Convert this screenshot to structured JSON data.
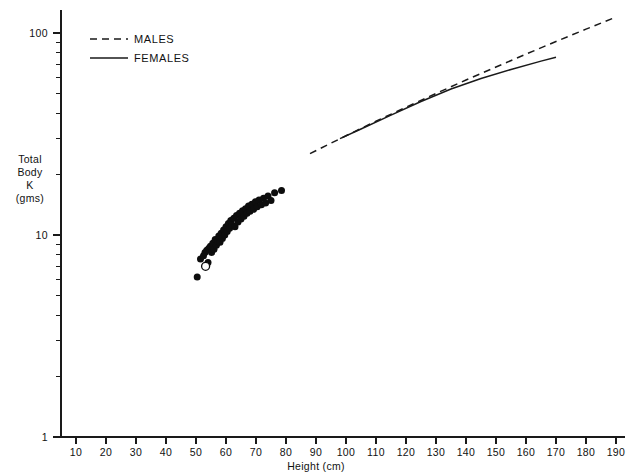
{
  "chart_data": {
    "type": "scatter",
    "title": "",
    "subtitle": "",
    "xlabel": "Height (cm)",
    "ylabel": "Total Body K (gms)",
    "ylabel_lines": [
      "Total",
      "Body",
      "K",
      "(gms)"
    ],
    "xscale": "linear",
    "yscale": "log",
    "xlim": [
      5,
      193
    ],
    "ylim": [
      1,
      130
    ],
    "grid": false,
    "xticks": [
      10,
      20,
      30,
      40,
      50,
      60,
      70,
      80,
      90,
      100,
      110,
      120,
      130,
      140,
      150,
      160,
      170,
      180,
      190
    ],
    "xtick_labels": [
      "10",
      "20",
      "30",
      "40",
      "50",
      "60",
      "70",
      "80",
      "90",
      "100",
      "110",
      "120",
      "130",
      "140",
      "150",
      "160",
      "170",
      "180",
      "190"
    ],
    "yticks": [
      1,
      10,
      100
    ],
    "ytick_labels": [
      "1",
      "10",
      "100"
    ],
    "ytick_minor": [
      2,
      3,
      4,
      5,
      6,
      7,
      8,
      9,
      20,
      30,
      40,
      50,
      60,
      70,
      80,
      90
    ],
    "legend_position": "top-left",
    "legend": [
      {
        "name": "MALES",
        "style": "dashed"
      },
      {
        "name": "FEMALES",
        "style": "solid"
      }
    ],
    "series": [
      {
        "name": "MALES",
        "type": "line",
        "style": "dashed",
        "x": [
          88,
          100,
          110,
          120,
          130,
          140,
          150,
          160,
          170,
          180,
          190
        ],
        "y": [
          25.3,
          31.0,
          36.6,
          42.9,
          50.2,
          58.5,
          67.9,
          78.6,
          90.8,
          104.5,
          120.0
        ]
      },
      {
        "name": "FEMALES",
        "type": "line",
        "style": "solid",
        "x": [
          98,
          105,
          115,
          125,
          135,
          145,
          155,
          165,
          170
        ],
        "y": [
          30.0,
          33.5,
          39.2,
          45.8,
          52.8,
          59.5,
          66.0,
          72.6,
          75.8
        ]
      },
      {
        "name": "individual subjects",
        "type": "scatter",
        "marker": "filled-circle",
        "points": [
          {
            "x": 50.4,
            "y": 6.2
          },
          {
            "x": 51.5,
            "y": 7.6
          },
          {
            "x": 52.5,
            "y": 7.9
          },
          {
            "x": 53.0,
            "y": 8.2
          },
          {
            "x": 53.6,
            "y": 8.4
          },
          {
            "x": 54.0,
            "y": 7.3
          },
          {
            "x": 54.3,
            "y": 8.6
          },
          {
            "x": 54.8,
            "y": 8.8
          },
          {
            "x": 55.2,
            "y": 8.2
          },
          {
            "x": 55.6,
            "y": 9.1
          },
          {
            "x": 56.0,
            "y": 8.5
          },
          {
            "x": 56.4,
            "y": 9.5
          },
          {
            "x": 56.8,
            "y": 8.9
          },
          {
            "x": 57.2,
            "y": 9.3
          },
          {
            "x": 57.6,
            "y": 9.9
          },
          {
            "x": 58.0,
            "y": 9.2
          },
          {
            "x": 58.4,
            "y": 10.2
          },
          {
            "x": 58.8,
            "y": 9.6
          },
          {
            "x": 59.2,
            "y": 10.6
          },
          {
            "x": 59.6,
            "y": 10.0
          },
          {
            "x": 60.0,
            "y": 11.0
          },
          {
            "x": 60.4,
            "y": 10.4
          },
          {
            "x": 60.8,
            "y": 11.4
          },
          {
            "x": 61.2,
            "y": 10.8
          },
          {
            "x": 61.6,
            "y": 11.8
          },
          {
            "x": 62.0,
            "y": 11.2
          },
          {
            "x": 62.6,
            "y": 12.1
          },
          {
            "x": 63.0,
            "y": 11.0
          },
          {
            "x": 63.5,
            "y": 12.5
          },
          {
            "x": 64.0,
            "y": 11.6
          },
          {
            "x": 64.5,
            "y": 12.8
          },
          {
            "x": 65.0,
            "y": 12.0
          },
          {
            "x": 65.5,
            "y": 13.2
          },
          {
            "x": 66.0,
            "y": 12.4
          },
          {
            "x": 66.5,
            "y": 13.5
          },
          {
            "x": 67.0,
            "y": 12.8
          },
          {
            "x": 67.5,
            "y": 13.9
          },
          {
            "x": 68.0,
            "y": 13.1
          },
          {
            "x": 68.6,
            "y": 14.2
          },
          {
            "x": 69.2,
            "y": 13.4
          },
          {
            "x": 69.8,
            "y": 14.6
          },
          {
            "x": 70.4,
            "y": 13.8
          },
          {
            "x": 71.0,
            "y": 14.9
          },
          {
            "x": 71.8,
            "y": 14.1
          },
          {
            "x": 72.5,
            "y": 15.2
          },
          {
            "x": 73.2,
            "y": 14.4
          },
          {
            "x": 74.0,
            "y": 15.6
          },
          {
            "x": 75.0,
            "y": 14.8
          },
          {
            "x": 76.2,
            "y": 16.2
          },
          {
            "x": 78.5,
            "y": 16.6
          }
        ]
      },
      {
        "name": "reference subject",
        "type": "scatter",
        "marker": "open-circle",
        "points": [
          {
            "x": 53.2,
            "y": 7.0
          }
        ]
      }
    ],
    "colors": {
      "ink": "#1a1a1a",
      "marker_fill": "#0d0d0d",
      "background": "#ffffff"
    }
  }
}
